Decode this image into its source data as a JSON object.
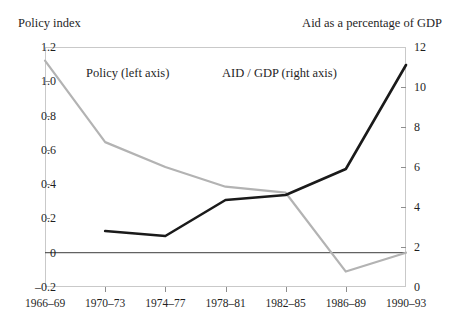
{
  "chart_data": {
    "type": "line",
    "title": "",
    "subtitle": "",
    "xlabel": "",
    "ylabel": "Policy index",
    "y2label": "Aid as a percentage of GDP",
    "categories": [
      "1966–69",
      "1970–73",
      "1974–77",
      "1978–81",
      "1982–85",
      "1986–89",
      "1990–93"
    ],
    "ylim": [
      -0.2,
      1.2
    ],
    "y2lim": [
      0,
      12
    ],
    "yticks": [
      "1.2",
      "1.0",
      "0.8",
      "0.6",
      "0.4",
      "0.2",
      "0",
      "–0.2"
    ],
    "ytick_values": [
      1.2,
      1.0,
      0.8,
      0.6,
      0.4,
      0.2,
      0,
      -0.2
    ],
    "y2ticks": [
      "12",
      "10",
      "8",
      "6",
      "4",
      "2",
      "0"
    ],
    "y2tick_values": [
      12,
      10,
      8,
      6,
      4,
      2,
      0
    ],
    "grid": false,
    "legend_position": "inline-annotation",
    "series": [
      {
        "name": "Policy (left axis)",
        "axis": "left",
        "color": "#b3b3b3",
        "values": [
          1.12,
          0.645,
          0.5,
          0.385,
          0.35,
          -0.11,
          0.0
        ]
      },
      {
        "name": "AID / GDP (right axis)",
        "axis": "right",
        "color": "#1a1a1a",
        "values": [
          null,
          2.8,
          2.55,
          4.35,
          4.6,
          5.9,
          11.1
        ]
      }
    ],
    "annotations": [
      {
        "text": "Policy (left axis)",
        "for": "Policy (left axis)"
      },
      {
        "text": "AID / GDP (right axis)",
        "for": "AID / GDP (right axis)"
      }
    ]
  }
}
